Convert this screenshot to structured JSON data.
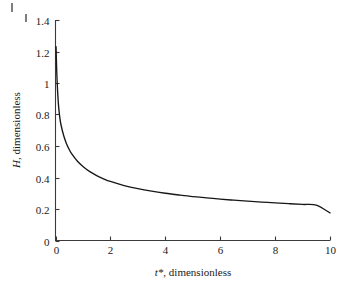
{
  "figure": {
    "background_color": "#ffffff",
    "curve_color": "#171717",
    "axis_color": "#3a3a3a"
  },
  "chart_data": {
    "type": "line",
    "title": "",
    "subtitle": "",
    "xlabel": "t*, dimensionless",
    "xlabel_variable": "t*",
    "xlabel_rest": ", dimensionless",
    "ylabel": "H, dimensionless",
    "ylabel_variable": "H",
    "ylabel_rest": ", dimensionless",
    "xlim": [
      0,
      10
    ],
    "ylim": [
      0,
      1.4
    ],
    "xticks": [
      0,
      2,
      4,
      6,
      8,
      10
    ],
    "xtick_labels": [
      "0",
      "2",
      "4",
      "6",
      "8",
      "10"
    ],
    "yticks": [
      0,
      0.2,
      0.4,
      0.6,
      0.8,
      1.0,
      1.2,
      1.4
    ],
    "ytick_labels": [
      "0",
      "0.2",
      "0.4",
      "0.6",
      "0.8",
      "1",
      "1.2",
      "1.4"
    ],
    "grid": false,
    "legend": null,
    "legend_position": "none",
    "series": [
      {
        "name": "H",
        "x": [
          0.02,
          0.05,
          0.1,
          0.15,
          0.2,
          0.3,
          0.4,
          0.5,
          0.6,
          0.8,
          1.0,
          1.25,
          1.5,
          1.75,
          2.0,
          2.5,
          3.0,
          3.5,
          4.0,
          4.5,
          5.0,
          5.5,
          6.0,
          6.5,
          7.0,
          7.5,
          8.0,
          8.5,
          9.0,
          9.5,
          10.0
        ],
        "y": [
          1.23,
          1.05,
          0.88,
          0.79,
          0.735,
          0.665,
          0.615,
          0.578,
          0.548,
          0.503,
          0.47,
          0.437,
          0.412,
          0.392,
          0.375,
          0.349,
          0.329,
          0.313,
          0.3,
          0.289,
          0.279,
          0.271,
          0.263,
          0.256,
          0.25,
          0.244,
          0.239,
          0.234,
          0.229,
          0.225,
          0.175
        ]
      }
    ],
    "annotations": []
  }
}
